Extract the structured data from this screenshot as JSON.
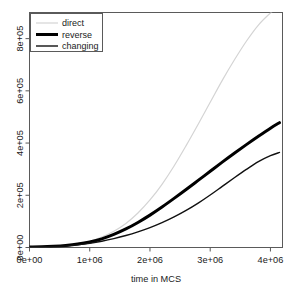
{
  "chart_data": {
    "type": "line",
    "title": "",
    "xlabel": "time in MCS",
    "ylabel": "",
    "xlim": [
      0,
      4200000
    ],
    "ylim": [
      0,
      900000
    ],
    "grid": false,
    "legend_position": "top-left",
    "xticks": [
      0,
      1000000,
      2000000,
      3000000,
      4000000
    ],
    "xtick_labels": [
      "0e+00",
      "1e+06",
      "2e+06",
      "3e+06",
      "4e+06"
    ],
    "yticks": [
      0,
      200000,
      400000,
      600000,
      800000
    ],
    "ytick_labels": [
      "0e+00",
      "2e+05",
      "4e+05",
      "6e+05",
      "8e+05"
    ],
    "x": [
      0,
      200000,
      400000,
      600000,
      800000,
      1000000,
      1200000,
      1400000,
      1600000,
      1800000,
      2000000,
      2200000,
      2400000,
      2600000,
      2800000,
      3000000,
      3200000,
      3400000,
      3600000,
      3800000,
      4000000,
      4150000
    ],
    "series": [
      {
        "name": "direct",
        "color": "#d4d4d4",
        "width": 1.2,
        "values": [
          2000,
          3000,
          5000,
          9000,
          15000,
          24000,
          40000,
          62000,
          92000,
          132000,
          182000,
          242000,
          312000,
          390000,
          472000,
          556000,
          640000,
          718000,
          790000,
          852000,
          898000,
          925000
        ]
      },
      {
        "name": "reverse",
        "color": "#000000",
        "width": 3.0,
        "values": [
          2000,
          3000,
          5000,
          8000,
          13000,
          21000,
          33000,
          50000,
          71000,
          96000,
          124000,
          155000,
          188000,
          222000,
          257000,
          292000,
          327000,
          361000,
          394000,
          426000,
          457000,
          478000
        ]
      },
      {
        "name": "changing",
        "color": "#111111",
        "width": 1.4,
        "values": [
          2000,
          3000,
          4000,
          6000,
          10000,
          16000,
          24000,
          34000,
          46000,
          60000,
          76000,
          95000,
          117000,
          142000,
          170000,
          201000,
          234000,
          267000,
          299000,
          329000,
          352000,
          364000
        ]
      }
    ]
  },
  "legend": {
    "entries": [
      {
        "label": "direct"
      },
      {
        "label": "reverse"
      },
      {
        "label": "changing"
      }
    ]
  },
  "axes": {
    "x_title": "time in MCS"
  },
  "colors": {
    "frame": "#5a5a5a",
    "text": "#1a1a1a",
    "background": "#ffffff",
    "series_direct": "#d4d4d4",
    "series_reverse": "#000000",
    "series_changing": "#111111"
  }
}
